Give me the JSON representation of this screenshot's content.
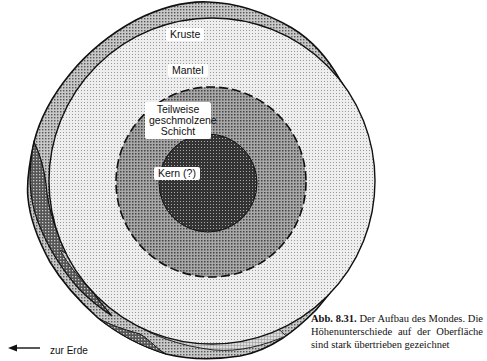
{
  "figure": {
    "layers": [
      {
        "id": "crust",
        "label": "Kruste"
      },
      {
        "id": "mantle",
        "label": "Mantel"
      },
      {
        "id": "partial_melt",
        "label_lines": [
          "Teilweise",
          "geschmolzene",
          "Schicht"
        ]
      },
      {
        "id": "core",
        "label": "Kern (?)"
      }
    ],
    "direction": {
      "label": "zur Erde",
      "arrow": "left-arrow"
    }
  },
  "caption": {
    "number": "Abb. 8.31.",
    "text": "Der Aufbau des Mondes. Die Höhenunterschiede auf der Oberfläche sind stark übertrieben gezeichnet"
  }
}
